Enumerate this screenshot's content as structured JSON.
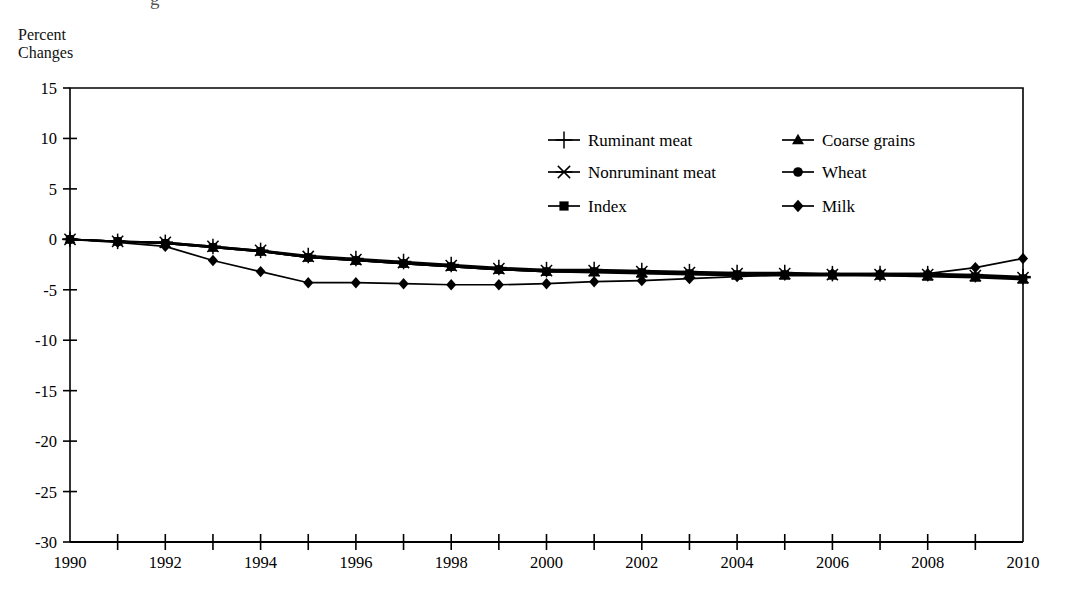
{
  "figure": {
    "axis_title": "Percent\nChanges",
    "partial_top_text": "g"
  },
  "chart_data": {
    "type": "line",
    "title": "",
    "subtitle": "",
    "xlabel": "",
    "ylabel": "Percent Changes",
    "xlim": [
      1990,
      2010
    ],
    "ylim": [
      -30,
      15
    ],
    "yticks": [
      15,
      10,
      5,
      0,
      -5,
      -10,
      -15,
      -20,
      -25,
      -30
    ],
    "ytick_labels": [
      "15",
      "10",
      "5",
      "0",
      "-5",
      "-10",
      "-15",
      "-20",
      "-25",
      "-30"
    ],
    "xticks": [
      1990,
      1991,
      1992,
      1993,
      1994,
      1995,
      1996,
      1997,
      1998,
      1999,
      2000,
      2001,
      2002,
      2003,
      2004,
      2005,
      2006,
      2007,
      2008,
      2009,
      2010
    ],
    "xtick_labels": [
      "1990",
      "",
      "1992",
      "",
      "1994",
      "",
      "1996",
      "",
      "1998",
      "",
      "2000",
      "",
      "2002",
      "",
      "2004",
      "",
      "2006",
      "",
      "2008",
      "",
      "2010"
    ],
    "grid": false,
    "legend_position": "upper-center",
    "x": [
      1990,
      1991,
      1992,
      1993,
      1994,
      1995,
      1996,
      1997,
      1998,
      1999,
      2000,
      2001,
      2002,
      2003,
      2004,
      2005,
      2006,
      2007,
      2008,
      2009,
      2010
    ],
    "series": [
      {
        "name": "Ruminant meat",
        "marker": "plus",
        "values": [
          0.0,
          -0.2,
          -0.3,
          -0.7,
          -1.1,
          -1.6,
          -1.9,
          -2.2,
          -2.5,
          -2.8,
          -3.0,
          -3.0,
          -3.1,
          -3.2,
          -3.3,
          -3.3,
          -3.4,
          -3.4,
          -3.4,
          -3.5,
          -3.7
        ]
      },
      {
        "name": "Nonruminant meat",
        "marker": "asterisk",
        "values": [
          0.0,
          -0.2,
          -0.3,
          -0.7,
          -1.1,
          -1.7,
          -2.0,
          -2.3,
          -2.6,
          -2.9,
          -3.1,
          -3.1,
          -3.2,
          -3.3,
          -3.4,
          -3.4,
          -3.5,
          -3.5,
          -3.5,
          -3.6,
          -3.8
        ]
      },
      {
        "name": "Index",
        "marker": "square",
        "values": [
          0.0,
          -0.2,
          -0.4,
          -0.8,
          -1.2,
          -1.8,
          -2.1,
          -2.4,
          -2.7,
          -3.0,
          -3.2,
          -3.2,
          -3.3,
          -3.4,
          -3.5,
          -3.5,
          -3.5,
          -3.5,
          -3.6,
          -3.7,
          -3.9
        ]
      },
      {
        "name": "Coarse grains",
        "marker": "triangle",
        "values": [
          0.0,
          -0.2,
          -0.4,
          -0.8,
          -1.2,
          -1.8,
          -2.1,
          -2.4,
          -2.7,
          -3.0,
          -3.2,
          -3.3,
          -3.4,
          -3.5,
          -3.6,
          -3.6,
          -3.6,
          -3.6,
          -3.7,
          -3.8,
          -4.0
        ]
      },
      {
        "name": "Wheat",
        "marker": "circle",
        "values": [
          0.0,
          -0.2,
          -0.4,
          -0.8,
          -1.2,
          -1.8,
          -2.1,
          -2.4,
          -2.7,
          -3.0,
          -3.2,
          -3.2,
          -3.3,
          -3.4,
          -3.5,
          -3.5,
          -3.5,
          -3.6,
          -3.6,
          -3.7,
          -3.9
        ]
      },
      {
        "name": "Milk",
        "marker": "diamond",
        "values": [
          0.0,
          -0.3,
          -0.7,
          -2.1,
          -3.2,
          -4.3,
          -4.3,
          -4.4,
          -4.5,
          -4.5,
          -4.4,
          -4.2,
          -4.1,
          -3.9,
          -3.7,
          -3.5,
          -3.4,
          -3.4,
          -3.4,
          -2.8,
          -1.9
        ]
      }
    ]
  },
  "legend": {
    "items": [
      {
        "label": "Ruminant meat",
        "marker": "plus"
      },
      {
        "label": "Nonruminant meat",
        "marker": "asterisk"
      },
      {
        "label": "Index",
        "marker": "square"
      },
      {
        "label": "Coarse grains",
        "marker": "triangle"
      },
      {
        "label": "Wheat",
        "marker": "circle"
      },
      {
        "label": "Milk",
        "marker": "diamond"
      }
    ]
  }
}
